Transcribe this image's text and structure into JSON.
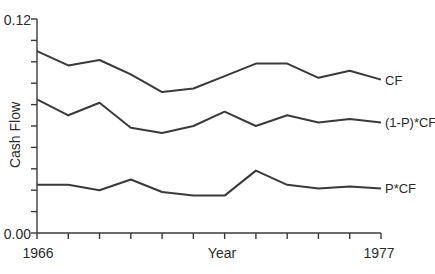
{
  "chart_data": {
    "type": "line",
    "title": "",
    "xlabel": "Year",
    "ylabel": "Cash Flow",
    "x": [
      1966,
      1967,
      1968,
      1969,
      1970,
      1971,
      1972,
      1973,
      1974,
      1975,
      1976,
      1977
    ],
    "xlim": [
      1966,
      1977
    ],
    "ylim": [
      0.0,
      0.12
    ],
    "y_tick_count": 10,
    "x_tick_count": 11,
    "y_tick_labels": [
      "0.00",
      "0.12"
    ],
    "x_tick_labels": [
      "1966",
      "1977"
    ],
    "grid": false,
    "legend_position": "inline-right",
    "series": [
      {
        "name": "CF",
        "values": [
          0.102,
          0.094,
          0.097,
          0.089,
          0.079,
          0.081,
          0.088,
          0.095,
          0.095,
          0.087,
          0.091,
          0.086
        ]
      },
      {
        "name": "(1-P)*CF",
        "values": [
          0.075,
          0.066,
          0.073,
          0.059,
          0.056,
          0.06,
          0.068,
          0.06,
          0.066,
          0.062,
          0.064,
          0.062
        ]
      },
      {
        "name": "P*CF",
        "values": [
          0.027,
          0.027,
          0.024,
          0.03,
          0.023,
          0.021,
          0.021,
          0.035,
          0.027,
          0.025,
          0.026,
          0.025
        ]
      }
    ]
  },
  "labels": {
    "y_top": "0.12",
    "y_bottom": "0.00",
    "x_left": "1966",
    "x_right": "1977",
    "x_title": "Year",
    "y_title": "Cash Flow",
    "series_cf": "CF",
    "series_one_minus_p": "(1-P)*CF",
    "series_p": "P*CF"
  }
}
